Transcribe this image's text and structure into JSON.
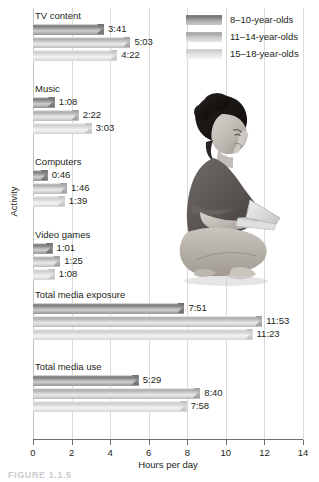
{
  "chart_data": {
    "type": "bar",
    "orientation": "horizontal",
    "title": "",
    "xlabel": "Hours per day",
    "ylabel": "Activity",
    "xlim": [
      0,
      14
    ],
    "xticks": [
      0,
      2,
      4,
      6,
      8,
      10,
      12,
      14
    ],
    "xticklabels": [
      "0",
      "2",
      "4",
      "6",
      "8",
      "10",
      "12",
      "14"
    ],
    "grid": "vertical",
    "legend_position": "top-right",
    "categories": [
      "TV content",
      "Music",
      "Computers",
      "Video games",
      "Total media exposure",
      "Total media use"
    ],
    "series": [
      {
        "name": "8–10-year-olds",
        "color": "#7c7e80",
        "labels": [
          "3:41",
          "1:08",
          "0:46",
          "1:01",
          "7:51",
          "5:29"
        ],
        "values": [
          3.683,
          1.133,
          0.767,
          1.017,
          7.85,
          5.483
        ]
      },
      {
        "name": "11–14-year-olds",
        "color": "#adafb1",
        "labels": [
          "5:03",
          "2:22",
          "1:46",
          "1:25",
          "11:53",
          "8:40"
        ],
        "values": [
          5.05,
          2.367,
          1.767,
          1.417,
          11.883,
          8.667
        ]
      },
      {
        "name": "15–18-year-olds",
        "color": "#d7d9da",
        "labels": [
          "4:22",
          "3:03",
          "1:39",
          "1:08",
          "11:23",
          "7:58"
        ],
        "values": [
          4.367,
          3.05,
          1.65,
          1.133,
          11.383,
          7.967
        ]
      }
    ]
  },
  "legend": {
    "items": [
      {
        "label": "8–10-year-olds",
        "swatch": "g1"
      },
      {
        "label": "11–14-year-olds",
        "swatch": "g2"
      },
      {
        "label": "15–18-year-olds",
        "swatch": "g3"
      }
    ]
  },
  "axes": {
    "x_title": "Hours per day",
    "y_title": "Activity",
    "x_ticks": [
      "0",
      "2",
      "4",
      "6",
      "8",
      "10",
      "12",
      "14"
    ]
  },
  "groups": [
    {
      "label": "TV content",
      "values": [
        "3:41",
        "5:03",
        "4:22"
      ]
    },
    {
      "label": "Music",
      "values": [
        "1:08",
        "2:22",
        "3:03"
      ]
    },
    {
      "label": "Computers",
      "values": [
        "0:46",
        "1:46",
        "1:39"
      ]
    },
    {
      "label": "Video games",
      "values": [
        "1:01",
        "1:25",
        "1:08"
      ]
    },
    {
      "label": "Total media exposure",
      "values": [
        "7:51",
        "11:53",
        "11:23"
      ]
    },
    {
      "label": "Total media use",
      "values": [
        "5:29",
        "8:40",
        "7:58"
      ]
    }
  ],
  "photo": {
    "alt": "woman-sitting-with-laptop"
  },
  "caption": {
    "text": "FIGURE 1.1.5"
  }
}
